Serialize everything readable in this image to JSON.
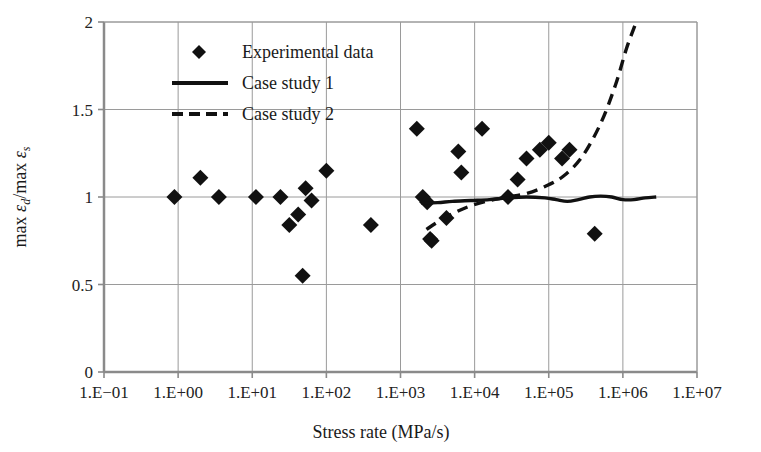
{
  "chart_data": {
    "type": "scatter",
    "title": "",
    "xlabel": "Stress rate (MPa/s)",
    "ylabel": "max εd/max εs",
    "ylabel_parts": {
      "prefix1": "max ",
      "var1": "ε",
      "sub1": "d",
      "slash": "/",
      "prefix2": "max ",
      "var2": "ε",
      "sub2": "s"
    },
    "x_scale": "log10",
    "xlim": [
      -1,
      7
    ],
    "ylim": [
      0,
      2
    ],
    "grid": true,
    "legend_position": "top-left-inside",
    "xtick_labels": [
      "1.E−01",
      "1.E+00",
      "1.E+01",
      "1.E+02",
      "1.E+03",
      "1.E+04",
      "1.E+05",
      "1.E+06",
      "1.E+07"
    ],
    "xtick_values": [
      -1,
      0,
      1,
      2,
      3,
      4,
      5,
      6,
      7
    ],
    "ytick_labels": [
      "0",
      "0.5",
      "1",
      "1.5",
      "2"
    ],
    "ytick_values": [
      0,
      0.5,
      1,
      1.5,
      2
    ],
    "series": [
      {
        "name": "Experimental data",
        "type": "scatter",
        "marker": "diamond",
        "color": "#111111",
        "points": [
          [
            -0.05,
            1.0
          ],
          [
            0.3,
            1.11
          ],
          [
            0.55,
            1.0
          ],
          [
            1.05,
            1.0
          ],
          [
            1.38,
            1.0
          ],
          [
            1.5,
            0.84
          ],
          [
            1.62,
            0.9
          ],
          [
            1.72,
            1.05
          ],
          [
            1.8,
            0.98
          ],
          [
            1.68,
            0.55
          ],
          [
            2.0,
            1.15
          ],
          [
            2.6,
            0.84
          ],
          [
            3.22,
            1.39
          ],
          [
            3.3,
            1.0
          ],
          [
            3.36,
            0.97
          ],
          [
            3.4,
            0.76
          ],
          [
            3.42,
            0.75
          ],
          [
            3.62,
            0.88
          ],
          [
            3.78,
            1.26
          ],
          [
            3.82,
            1.14
          ],
          [
            4.1,
            1.39
          ],
          [
            4.45,
            1.0
          ],
          [
            4.58,
            1.1
          ],
          [
            4.7,
            1.22
          ],
          [
            4.88,
            1.27
          ],
          [
            5.0,
            1.31
          ],
          [
            5.18,
            1.22
          ],
          [
            5.28,
            1.27
          ],
          [
            5.62,
            0.79
          ]
        ]
      },
      {
        "name": "Case study 1",
        "type": "line",
        "style": "solid",
        "color": "#111111",
        "points": [
          [
            3.28,
            0.965
          ],
          [
            3.5,
            0.968
          ],
          [
            3.7,
            0.975
          ],
          [
            3.95,
            0.98
          ],
          [
            4.2,
            0.985
          ],
          [
            4.45,
            0.995
          ],
          [
            4.7,
            1.0
          ],
          [
            4.95,
            0.995
          ],
          [
            5.1,
            0.985
          ],
          [
            5.25,
            0.975
          ],
          [
            5.4,
            0.985
          ],
          [
            5.55,
            1.0
          ],
          [
            5.7,
            1.005
          ],
          [
            5.85,
            1.0
          ],
          [
            6.0,
            0.985
          ],
          [
            6.15,
            0.985
          ],
          [
            6.3,
            0.995
          ],
          [
            6.45,
            1.0
          ]
        ]
      },
      {
        "name": "Case study 2",
        "type": "line",
        "style": "dashed",
        "color": "#111111",
        "points": [
          [
            3.35,
            0.815
          ],
          [
            3.55,
            0.87
          ],
          [
            3.75,
            0.915
          ],
          [
            3.95,
            0.95
          ],
          [
            4.2,
            0.98
          ],
          [
            4.45,
            1.0
          ],
          [
            4.7,
            1.02
          ],
          [
            4.95,
            1.06
          ],
          [
            5.2,
            1.12
          ],
          [
            5.45,
            1.23
          ],
          [
            5.7,
            1.42
          ],
          [
            5.9,
            1.64
          ],
          [
            6.05,
            1.85
          ],
          [
            6.18,
            2.0
          ]
        ]
      }
    ],
    "legend": [
      {
        "label": "Experimental data",
        "marker": "diamond",
        "style": "marker"
      },
      {
        "label": "Case study 1",
        "marker": "line",
        "style": "solid"
      },
      {
        "label": "Case study 2",
        "marker": "line",
        "style": "dashed"
      }
    ],
    "colors": {
      "axis": "#8a8a8a",
      "grid": "#9a9a9a",
      "data": "#111111",
      "background": "#ffffff"
    }
  }
}
